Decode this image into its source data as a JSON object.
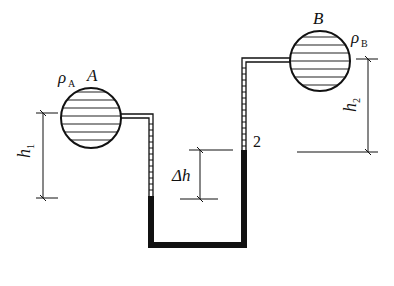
{
  "labels": {
    "tank_a": "A",
    "rho_a": "ρ",
    "rho_a_sub": "A",
    "tank_b": "B",
    "rho_b": "ρ",
    "rho_b_sub": "B",
    "h1": "h",
    "h1_sub": "1",
    "h2": "h",
    "h2_sub": "2",
    "delta_h": "Δh",
    "point_2": "2"
  },
  "colors": {
    "line": "#111111",
    "background": "#ffffff"
  }
}
